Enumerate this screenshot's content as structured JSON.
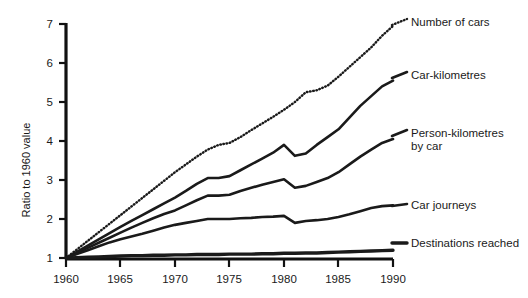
{
  "chart_data": {
    "type": "line",
    "title": "",
    "subtitle": "",
    "xlabel": "",
    "ylabel": "Ratio to 1960 value",
    "xlim": [
      1960,
      1990
    ],
    "ylim": [
      1,
      7
    ],
    "grid": false,
    "legend_position": "right-of-plot-inline",
    "x_ticks": [
      "1960",
      "1965",
      "1970",
      "1975",
      "1980",
      "1985",
      "1990"
    ],
    "y_ticks": [
      "1",
      "2",
      "3",
      "4",
      "5",
      "6",
      "7"
    ],
    "x": [
      1960,
      1961,
      1962,
      1963,
      1964,
      1965,
      1966,
      1967,
      1968,
      1969,
      1970,
      1971,
      1972,
      1973,
      1974,
      1975,
      1976,
      1977,
      1978,
      1979,
      1980,
      1981,
      1982,
      1983,
      1984,
      1985,
      1986,
      1987,
      1988,
      1989,
      1990
    ],
    "series": [
      {
        "name": "Number of cars",
        "style": "dotted",
        "values": [
          1.0,
          1.22,
          1.44,
          1.66,
          1.88,
          2.1,
          2.32,
          2.54,
          2.76,
          2.98,
          3.2,
          3.4,
          3.6,
          3.78,
          3.9,
          3.95,
          4.1,
          4.28,
          4.45,
          4.62,
          4.8,
          5.0,
          5.25,
          5.3,
          5.42,
          5.65,
          5.9,
          6.15,
          6.4,
          6.7,
          6.95
        ]
      },
      {
        "name": "Car-kilometres",
        "style": "solid",
        "values": [
          1.0,
          1.16,
          1.32,
          1.48,
          1.64,
          1.8,
          1.95,
          2.1,
          2.25,
          2.4,
          2.55,
          2.72,
          2.9,
          3.05,
          3.05,
          3.1,
          3.25,
          3.4,
          3.55,
          3.7,
          3.9,
          3.62,
          3.68,
          3.9,
          4.1,
          4.3,
          4.6,
          4.9,
          5.15,
          5.4,
          5.55
        ]
      },
      {
        "name": "Person-kilometres by car",
        "style": "solid",
        "values": [
          1.0,
          1.13,
          1.26,
          1.39,
          1.52,
          1.65,
          1.78,
          1.9,
          2.02,
          2.13,
          2.22,
          2.35,
          2.48,
          2.6,
          2.6,
          2.62,
          2.72,
          2.8,
          2.88,
          2.95,
          3.02,
          2.8,
          2.85,
          2.95,
          3.05,
          3.2,
          3.4,
          3.6,
          3.78,
          3.95,
          4.05
        ]
      },
      {
        "name": "Car journeys",
        "style": "solid",
        "values": [
          1.0,
          1.1,
          1.2,
          1.3,
          1.4,
          1.48,
          1.55,
          1.62,
          1.7,
          1.78,
          1.85,
          1.9,
          1.95,
          2.0,
          2.0,
          2.0,
          2.02,
          2.03,
          2.05,
          2.06,
          2.08,
          1.9,
          1.95,
          1.97,
          2.0,
          2.05,
          2.12,
          2.2,
          2.28,
          2.33,
          2.35
        ]
      },
      {
        "name": "Destinations reached",
        "style": "solid-thick",
        "values": [
          1.0,
          1.01,
          1.02,
          1.03,
          1.04,
          1.05,
          1.06,
          1.06,
          1.07,
          1.07,
          1.08,
          1.08,
          1.09,
          1.09,
          1.09,
          1.1,
          1.1,
          1.1,
          1.11,
          1.11,
          1.12,
          1.12,
          1.13,
          1.13,
          1.14,
          1.15,
          1.16,
          1.17,
          1.18,
          1.19,
          1.2
        ]
      }
    ]
  },
  "labels": {
    "y_axis_title": "Ratio to 1960 value",
    "series_0": "Number of cars",
    "series_1": "Car-kilometres",
    "series_2a": "Person-kilometres",
    "series_2b": "by car",
    "series_3": "Car journeys",
    "series_4": "Destinations reached",
    "ytick_7": "7",
    "ytick_6": "6",
    "ytick_5": "5",
    "ytick_4": "4",
    "ytick_3": "3",
    "ytick_2": "2",
    "ytick_1": "1",
    "xtick_1960": "1960",
    "xtick_1965": "1965",
    "xtick_1970": "1970",
    "xtick_1975": "1975",
    "xtick_1980": "1980",
    "xtick_1985": "1985",
    "xtick_1990": "1990"
  },
  "colors": {
    "axis": "#111111",
    "line": "#1a1a1a",
    "background": "#ffffff"
  }
}
